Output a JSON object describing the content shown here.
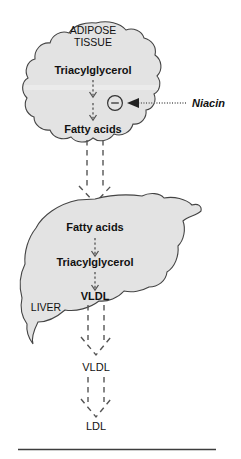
{
  "figure": {
    "accent_color": "#e3e3e3",
    "outline_color": "#444444",
    "arrow_color": "#555555"
  },
  "adipose": {
    "organ_label": "ADIPOSE",
    "organ_label_2": "TISSUE",
    "substrate": "Triacylglycerol",
    "product": "Fatty acids"
  },
  "inhibition": {
    "symbol": "−",
    "agent": "Niacin"
  },
  "liver": {
    "organ_label": "LIVER",
    "substrate": "Fatty acids",
    "intermediate": "Triacylglycerol",
    "product": "VLDL"
  },
  "plasma": {
    "vldl": "VLDL",
    "ldl": "LDL"
  }
}
